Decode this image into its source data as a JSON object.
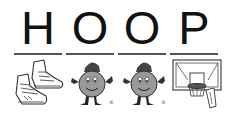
{
  "word": {
    "letters": [
      "H",
      "O",
      "O",
      "P"
    ]
  },
  "pictures": [
    {
      "name": "sneakers",
      "icon": "sneakers-icon"
    },
    {
      "name": "mascot",
      "icon": "mascot-icon",
      "mark": "®"
    },
    {
      "name": "mascot",
      "icon": "mascot-icon",
      "mark": "®"
    },
    {
      "name": "basketball hoop",
      "icon": "basketball-hoop-icon"
    }
  ]
}
